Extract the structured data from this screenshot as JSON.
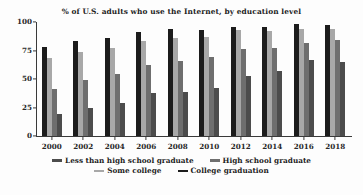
{
  "chart_data": {
    "type": "bar",
    "title": "% of U.S. adults who use the Internet, by education level",
    "xlabel": "",
    "ylabel": "",
    "ylim": [
      0,
      100
    ],
    "yticks": [
      0,
      25,
      50,
      75,
      100
    ],
    "grid": false,
    "legend_position": "bottom",
    "categories": [
      "2000",
      "2002",
      "2004",
      "2006",
      "2008",
      "2010",
      "2012",
      "2014",
      "2016",
      "2018"
    ],
    "bar_draw_order": [
      "College graduation",
      "Some college",
      "High school graduate",
      "Less than high school graduate"
    ],
    "series": [
      {
        "name": "Less than high school graduate",
        "color": "#4c4c4c",
        "values": [
          19,
          25,
          29,
          38,
          39,
          42,
          53,
          57,
          67,
          65
        ]
      },
      {
        "name": "High school graduate",
        "color": "#6e6e6e",
        "values": [
          41,
          49,
          54,
          62,
          66,
          69,
          76,
          77,
          82,
          84
        ]
      },
      {
        "name": "Some college",
        "color": "#a8a8a8",
        "values": [
          68,
          74,
          77,
          83,
          86,
          87,
          93,
          92,
          94,
          94
        ]
      },
      {
        "name": "College graduation",
        "color": "#1c1c1c",
        "values": [
          78,
          83,
          86,
          91,
          94,
          93,
          96,
          96,
          98,
          97
        ]
      }
    ]
  },
  "legend": {
    "rows": [
      [
        {
          "label": "Less than high school graduate",
          "color": "#4c4c4c"
        },
        {
          "label": "High school graduate",
          "color": "#6e6e6e"
        }
      ],
      [
        {
          "label": "Some college",
          "color": "#a8a8a8"
        },
        {
          "label": "College graduation",
          "color": "#1c1c1c"
        }
      ]
    ]
  }
}
